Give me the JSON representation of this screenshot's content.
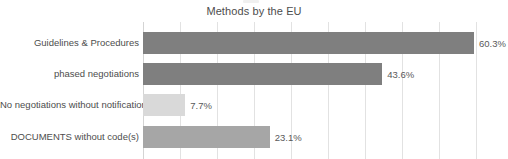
{
  "chart_data": {
    "type": "bar",
    "orientation": "horizontal",
    "title": "Methods by the EU",
    "xlabel": "",
    "ylabel": "",
    "categories": [
      "Guidelines & Procedures",
      "phased negotiations",
      "No negotiations without notification",
      "DOCUMENTS without code(s)"
    ],
    "values": [
      60.3,
      43.6,
      7.7,
      23.1
    ],
    "value_labels": [
      "60.3%",
      "43.6%",
      "7.7%",
      "23.1%"
    ],
    "bar_colors": [
      "#7f7f7f",
      "#7f7f7f",
      "#d9d9d9",
      "#a6a6a6"
    ],
    "xlim": [
      0,
      66.5
    ],
    "grid": true,
    "grid_axis": "x",
    "grid_interval_percent": 6.75,
    "gridline_count": 10,
    "legend": "none",
    "axis_tick_labels_visible": false,
    "note": "x-axis tick labels are cropped out of the image; bars extend rightward from a left baseline"
  },
  "style": {
    "background": "#ffffff",
    "gridline_color": "#e2e2e2",
    "axis_line_color": "#d4d4d4",
    "title_color": "#4d4d4d",
    "label_color": "#4d4d4d",
    "value_label_color": "#595959"
  }
}
